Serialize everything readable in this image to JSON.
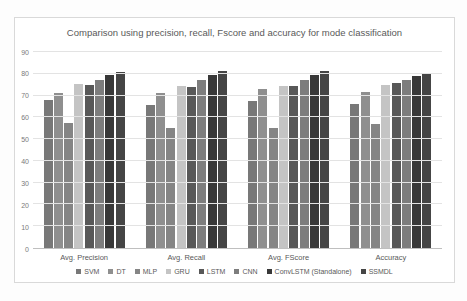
{
  "figure": {
    "title": "Comparison using precision, recall, Fscore and accuracy for mode classification"
  },
  "chart_data": {
    "type": "bar",
    "title": "Comparison using precision, recall, Fscore and accuracy for mode classification",
    "categories": [
      "Avg. Precision",
      "Avg. Recall",
      "Avg. FScore",
      "Accuracy"
    ],
    "series": [
      {
        "name": "SVM",
        "color": "#787878",
        "values": [
          68,
          65.5,
          67.5,
          66
        ]
      },
      {
        "name": "DT",
        "color": "#8f8f8f",
        "values": [
          71,
          71,
          73,
          71.5
        ]
      },
      {
        "name": "MLP",
        "color": "#858585",
        "values": [
          57.5,
          55,
          55,
          57
        ]
      },
      {
        "name": "GRU",
        "color": "#c4c4c4",
        "values": [
          75.5,
          74.5,
          74.5,
          75
        ]
      },
      {
        "name": "LSTM",
        "color": "#585858",
        "values": [
          75,
          74,
          74.5,
          76
        ]
      },
      {
        "name": "CNN",
        "color": "#7d7d7d",
        "values": [
          77,
          77,
          77,
          77
        ]
      },
      {
        "name": "ConvLSTM (Standalone)",
        "color": "#383838",
        "values": [
          79.5,
          79.5,
          79.5,
          79
        ]
      },
      {
        "name": "SSMDL",
        "color": "#454545",
        "values": [
          81,
          81.5,
          81.5,
          80.5
        ]
      }
    ],
    "xlabel": "",
    "ylabel": "",
    "ylim": [
      0,
      90
    ],
    "yticks": [
      0,
      10,
      20,
      30,
      40,
      50,
      60,
      70,
      80,
      90
    ],
    "grid": true,
    "legend_position": "bottom",
    "colors": {
      "grid": "#e3e3e3",
      "axis": "#bfbfbf",
      "text": "#595959",
      "border": "#d9d9d9",
      "background": "#ffffff"
    }
  }
}
